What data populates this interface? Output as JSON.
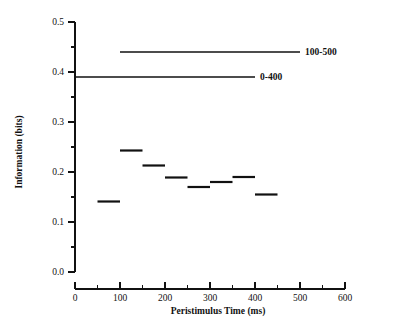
{
  "chart_data": {
    "type": "line",
    "title": "",
    "subtitle": "",
    "xlabel": "Peristimulus Time (ms)",
    "ylabel": "Information (bits)",
    "xlim": [
      0,
      600
    ],
    "ylim": [
      0.0,
      0.5
    ],
    "grid": false,
    "legend_position": "inline-right",
    "x_ticks": [
      0,
      100,
      200,
      300,
      400,
      500,
      600
    ],
    "x_tick_labels": [
      "0",
      "100",
      "200",
      "300",
      "400",
      "500",
      "600"
    ],
    "x_minor_ticks": [
      50,
      150,
      250,
      350,
      450,
      550
    ],
    "y_ticks": [
      0.0,
      0.1,
      0.2,
      0.3,
      0.4,
      0.5
    ],
    "y_tick_labels": [
      "0.0",
      "0.1",
      "0.2",
      "0.3",
      "0.4",
      "0.5"
    ],
    "y_minor_ticks": [
      0.05,
      0.15,
      0.25,
      0.35,
      0.45
    ],
    "series": [
      {
        "name": "windowed-information",
        "type": "step-segments",
        "label": "",
        "segments": [
          {
            "x_start": 50,
            "x_end": 100,
            "value": 0.141
          },
          {
            "x_start": 100,
            "x_end": 150,
            "value": 0.243
          },
          {
            "x_start": 150,
            "x_end": 200,
            "value": 0.213
          },
          {
            "x_start": 200,
            "x_end": 250,
            "value": 0.189
          },
          {
            "x_start": 250,
            "x_end": 300,
            "value": 0.17
          },
          {
            "x_start": 300,
            "x_end": 350,
            "value": 0.18
          },
          {
            "x_start": 350,
            "x_end": 400,
            "value": 0.19
          },
          {
            "x_start": 400,
            "x_end": 450,
            "value": 0.155
          }
        ]
      },
      {
        "name": "window-100-500",
        "type": "reference-line",
        "label": "100-500",
        "x_start": 100,
        "x_end": 500,
        "value": 0.44
      },
      {
        "name": "window-0-400",
        "type": "reference-line",
        "label": "0-400",
        "x_start": 0,
        "x_end": 400,
        "value": 0.39
      }
    ]
  },
  "colors": {
    "ink": "#111111",
    "background": "#ffffff"
  }
}
